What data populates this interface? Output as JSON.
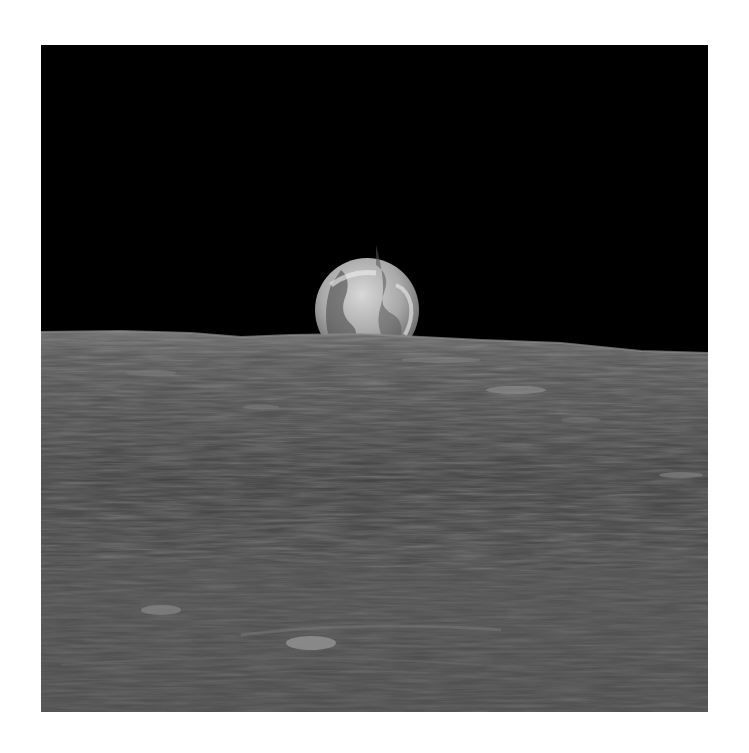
{
  "page": {
    "background": "#ffffff"
  },
  "photo": {
    "subject": "Earth rising over lunar horizon",
    "sky_color": "#000000",
    "surface_color": "#4a4a4a",
    "earth": {
      "cx": 326,
      "cy": 252,
      "r": 52,
      "visible_fraction": "upper portion above horizon"
    },
    "horizon": {
      "left_y": 287,
      "right_y": 308
    }
  }
}
